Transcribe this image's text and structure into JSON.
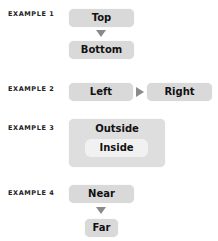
{
  "examples": [
    {
      "label": "EXAMPLE 1",
      "boxes": [
        "Top",
        "Bottom"
      ],
      "arrow": "down"
    },
    {
      "label": "EXAMPLE 2",
      "boxes": [
        "Left",
        "Right"
      ],
      "arrow": "right"
    },
    {
      "label": "EXAMPLE 3",
      "outer": "Outside",
      "inner": "Inside"
    },
    {
      "label": "EXAMPLE 4",
      "boxes": [
        "Near",
        "Far"
      ],
      "arrow": "down"
    }
  ],
  "colors": {
    "box": "#d9d9d9",
    "inner": "#f1f1f1",
    "arrow": "#8a8a8a"
  }
}
